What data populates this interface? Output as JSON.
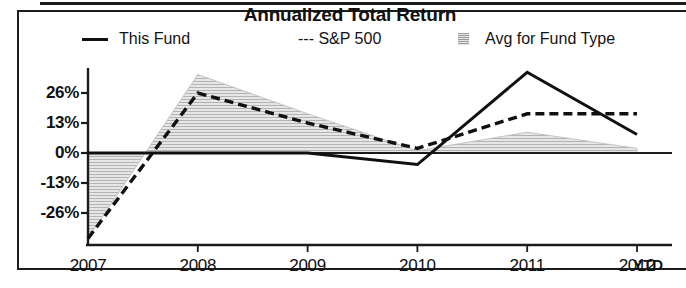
{
  "chart_data": {
    "type": "line",
    "title": "Annualized Total Return",
    "xlabel": "",
    "ylabel": "",
    "categories": [
      "2007",
      "2008",
      "2009",
      "2010",
      "2011",
      "2012"
    ],
    "x_tick_labels": [
      "2007",
      "2008",
      "2009",
      "2010",
      "2011",
      "2012"
    ],
    "x_axis_suffix": "YTD",
    "y_tick_labels": [
      "26%",
      "13%",
      "0%",
      "-13%",
      "-26%"
    ],
    "y_tick_values": [
      26,
      13,
      0,
      -13,
      -26
    ],
    "ylim": [
      -40,
      40
    ],
    "grid": false,
    "legend_position": "top",
    "series": [
      {
        "name": "This Fund",
        "style": "solid",
        "color": "#101010",
        "values": [
          0,
          0,
          0,
          -5,
          35,
          8
        ]
      },
      {
        "name": "S&P 500",
        "style": "dashed",
        "color": "#101010",
        "values": [
          -37,
          26,
          13,
          2,
          17,
          17
        ]
      },
      {
        "name": "Avg for Fund Type",
        "style": "area",
        "color": "#d9d9d9",
        "values": [
          -37,
          34,
          17,
          1,
          9,
          2
        ]
      }
    ],
    "baseline": 0
  },
  "legend": {
    "items": [
      {
        "label": "This Fund",
        "swatch": "solid-line-swatch"
      },
      {
        "label": "--- S&P 500",
        "swatch": "dashed-line-swatch"
      },
      {
        "label": "Avg for Fund Type",
        "swatch": "shaded-area-swatch"
      }
    ]
  }
}
